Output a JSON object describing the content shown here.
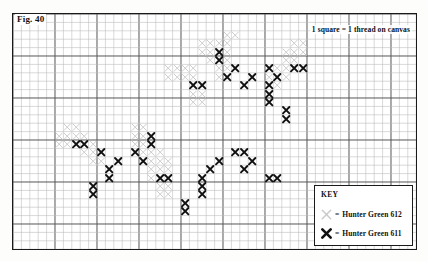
{
  "figure": {
    "label": "Fig. 40",
    "note": "1 square = 1 thread on canvas"
  },
  "key": {
    "title": "KEY",
    "equals": "=",
    "entries": [
      {
        "symbol": "light-x-icon",
        "color": "#c9c9c9",
        "label": "Hunter Green 612"
      },
      {
        "symbol": "dark-x-icon",
        "color": "#111111",
        "label": "Hunter Green 611"
      }
    ]
  },
  "chart_data": {
    "type": "grid-pattern-chart",
    "title": "Fig. 40",
    "cols": 48,
    "rows": 28,
    "cell_px": 8.4,
    "major_every": 5,
    "grid": true,
    "legend_position": "bottom-right",
    "colors": {
      "light": "#c9c9c9",
      "dark": "#111111",
      "minor_line": "#b9b9b9",
      "major_line": "#555555",
      "border": "#1a1a1a"
    },
    "symbols": {
      "light": "Hunter Green 612",
      "dark": "Hunter Green 611"
    },
    "light_cells": [
      [
        25,
        2
      ],
      [
        26,
        2
      ],
      [
        22,
        3
      ],
      [
        23,
        3
      ],
      [
        24,
        3
      ],
      [
        25,
        3
      ],
      [
        33,
        3
      ],
      [
        34,
        3
      ],
      [
        22,
        4
      ],
      [
        23,
        4
      ],
      [
        24,
        4
      ],
      [
        25,
        4
      ],
      [
        32,
        4
      ],
      [
        33,
        4
      ],
      [
        34,
        4
      ],
      [
        23,
        5
      ],
      [
        24,
        5
      ],
      [
        25,
        5
      ],
      [
        32,
        5
      ],
      [
        33,
        5
      ],
      [
        18,
        6
      ],
      [
        19,
        6
      ],
      [
        20,
        6
      ],
      [
        21,
        6
      ],
      [
        24,
        6
      ],
      [
        25,
        6
      ],
      [
        31,
        6
      ],
      [
        32,
        6
      ],
      [
        33,
        6
      ],
      [
        18,
        7
      ],
      [
        19,
        7
      ],
      [
        20,
        7
      ],
      [
        21,
        7
      ],
      [
        24,
        7
      ],
      [
        25,
        7
      ],
      [
        30,
        7
      ],
      [
        31,
        7
      ],
      [
        32,
        7
      ],
      [
        21,
        8
      ],
      [
        22,
        8
      ],
      [
        30,
        8
      ],
      [
        31,
        8
      ],
      [
        21,
        9
      ],
      [
        22,
        9
      ],
      [
        21,
        10
      ],
      [
        22,
        10
      ],
      [
        6,
        13
      ],
      [
        7,
        13
      ],
      [
        14,
        13
      ],
      [
        15,
        13
      ],
      [
        5,
        14
      ],
      [
        6,
        14
      ],
      [
        7,
        14
      ],
      [
        8,
        14
      ],
      [
        14,
        14
      ],
      [
        15,
        14
      ],
      [
        16,
        14
      ],
      [
        5,
        15
      ],
      [
        6,
        15
      ],
      [
        7,
        15
      ],
      [
        8,
        15
      ],
      [
        9,
        15
      ],
      [
        14,
        15
      ],
      [
        15,
        15
      ],
      [
        16,
        15
      ],
      [
        8,
        16
      ],
      [
        9,
        16
      ],
      [
        10,
        16
      ],
      [
        15,
        16
      ],
      [
        16,
        16
      ],
      [
        17,
        16
      ],
      [
        9,
        17
      ],
      [
        10,
        17
      ],
      [
        16,
        17
      ],
      [
        17,
        17
      ],
      [
        18,
        17
      ],
      [
        16,
        18
      ],
      [
        17,
        18
      ],
      [
        18,
        18
      ],
      [
        16,
        19
      ],
      [
        17,
        19
      ],
      [
        18,
        19
      ],
      [
        17,
        20
      ],
      [
        18,
        20
      ],
      [
        17,
        21
      ],
      [
        18,
        21
      ]
    ],
    "dark_cells": [
      [
        24,
        4
      ],
      [
        24,
        5
      ],
      [
        26,
        6
      ],
      [
        30,
        6
      ],
      [
        33,
        6
      ],
      [
        34,
        6
      ],
      [
        25,
        7
      ],
      [
        28,
        7
      ],
      [
        31,
        7
      ],
      [
        21,
        8
      ],
      [
        22,
        8
      ],
      [
        27,
        8
      ],
      [
        30,
        8
      ],
      [
        30,
        9
      ],
      [
        30,
        10
      ],
      [
        32,
        11
      ],
      [
        32,
        12
      ],
      [
        16,
        14
      ],
      [
        7,
        15
      ],
      [
        8,
        15
      ],
      [
        16,
        15
      ],
      [
        10,
        16
      ],
      [
        14,
        16
      ],
      [
        26,
        16
      ],
      [
        27,
        16
      ],
      [
        12,
        17
      ],
      [
        15,
        17
      ],
      [
        24,
        17
      ],
      [
        28,
        17
      ],
      [
        11,
        18
      ],
      [
        23,
        18
      ],
      [
        27,
        18
      ],
      [
        11,
        19
      ],
      [
        17,
        19
      ],
      [
        18,
        19
      ],
      [
        22,
        19
      ],
      [
        30,
        19
      ],
      [
        31,
        19
      ],
      [
        9,
        20
      ],
      [
        22,
        20
      ],
      [
        9,
        21
      ],
      [
        22,
        21
      ],
      [
        20,
        22
      ],
      [
        20,
        23
      ]
    ]
  }
}
